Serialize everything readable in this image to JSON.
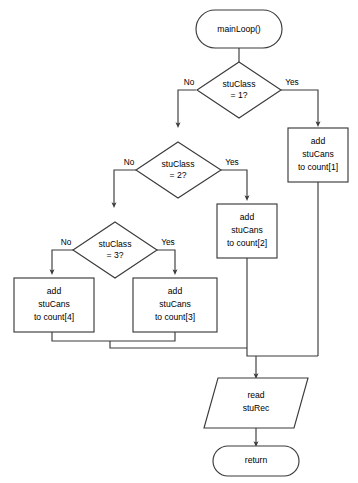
{
  "diagram": {
    "type": "flowchart",
    "nodes": {
      "start": {
        "shape": "terminator",
        "label": "mainLoop()"
      },
      "decision1": {
        "shape": "decision",
        "line1": "stuClass",
        "line2": "= 1?",
        "yes_label": "Yes",
        "no_label": "No"
      },
      "decision2": {
        "shape": "decision",
        "line1": "stuClass",
        "line2": "= 2?",
        "yes_label": "Yes",
        "no_label": "No"
      },
      "decision3": {
        "shape": "decision",
        "line1": "stuClass",
        "line2": "= 3?",
        "yes_label": "Yes",
        "no_label": "No"
      },
      "process1": {
        "shape": "process",
        "line1": "add",
        "line2": "stuCans",
        "line3": "to count[1]"
      },
      "process2": {
        "shape": "process",
        "line1": "add",
        "line2": "stuCans",
        "line3": "to count[2]"
      },
      "process3": {
        "shape": "process",
        "line1": "add",
        "line2": "stuCans",
        "line3": "to count[3]"
      },
      "process4": {
        "shape": "process",
        "line1": "add",
        "line2": "stuCans",
        "line3": "to count[4]"
      },
      "io_read": {
        "shape": "parallelogram",
        "line1": "read",
        "line2": "stuRec"
      },
      "end": {
        "shape": "terminator",
        "label": "return"
      }
    },
    "colors": {
      "stroke": "#3b3b3b",
      "fill": "#ffffff",
      "text": "#000000",
      "background": "#ffffff"
    }
  }
}
